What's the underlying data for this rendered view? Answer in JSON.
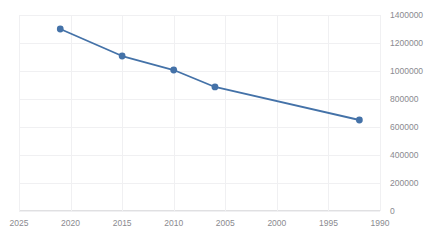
{
  "chart_data": {
    "type": "line",
    "title": "",
    "xlabel": "",
    "ylabel": "",
    "x": [
      2021,
      2015,
      2010,
      2006,
      1992
    ],
    "values": [
      1300000,
      1107000,
      1007000,
      886000,
      650000
    ],
    "series": [
      {
        "name": "",
        "x": [
          2021,
          2015,
          2010,
          2006,
          1992
        ],
        "values": [
          1300000,
          1107000,
          1007000,
          886000,
          650000
        ]
      }
    ],
    "xlim": [
      2025,
      1990
    ],
    "ylim": [
      0,
      1400000
    ],
    "x_reversed": true,
    "y_axis_position": "right",
    "grid": true,
    "legend": false,
    "xticks": [
      "2025",
      "2020",
      "2015",
      "2010",
      "2005",
      "2000",
      "1995",
      "1990"
    ],
    "xtick_values": [
      2025,
      2020,
      2015,
      2010,
      2005,
      2000,
      1995,
      1990
    ],
    "yticks": [
      "0",
      "200000",
      "400000",
      "600000",
      "800000",
      "1000000",
      "1200000",
      "1400000"
    ],
    "ytick_values": [
      0,
      200000,
      400000,
      600000,
      800000,
      1000000,
      1200000,
      1400000
    ],
    "marker": "circle",
    "colors": {
      "series_line": "#4472a8",
      "marker_fill": "#4472a8",
      "grid": "#f0f0f2",
      "axis": "#e0e0e2",
      "tick_label": "#8a8a8f",
      "background": "#ffffff"
    }
  }
}
